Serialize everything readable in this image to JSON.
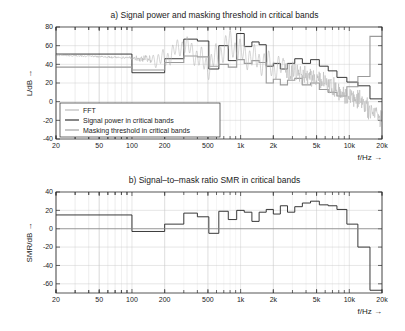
{
  "figure": {
    "xlabel": "f/Hz →",
    "xticks": [
      {
        "v": 20,
        "label": "20"
      },
      {
        "v": 50,
        "label": "50"
      },
      {
        "v": 100,
        "label": "100"
      },
      {
        "v": 200,
        "label": "200"
      },
      {
        "v": 500,
        "label": "500"
      },
      {
        "v": 1000,
        "label": "1k"
      },
      {
        "v": 2000,
        "label": "2k"
      },
      {
        "v": 5000,
        "label": "5k"
      },
      {
        "v": 10000,
        "label": "10k"
      },
      {
        "v": 20000,
        "label": "20k"
      }
    ]
  },
  "chart_data": [
    {
      "type": "line",
      "id": "panel-a",
      "title": "a) Signal power and masking threshold in critical bands",
      "xlabel": "f/Hz →",
      "ylabel": "L/dB →",
      "xscale": "log",
      "xlim": [
        20,
        20000
      ],
      "ylim": [
        -40,
        80
      ],
      "yticks": [
        -40,
        -20,
        0,
        20,
        40,
        60,
        80
      ],
      "ytick_labels": [
        "-40",
        "-20",
        "0",
        "20",
        "40",
        "60",
        "80"
      ],
      "grid": true,
      "legend_position": "lower-left",
      "legend": [
        {
          "name": "FFT",
          "color": "#b4b4b4"
        },
        {
          "name": "Signal power in critical bands",
          "color": "#232323"
        },
        {
          "name": "Masking threshold in critical bands",
          "color": "#9a9a9a"
        }
      ],
      "series": [
        {
          "name": "Signal power in critical bands",
          "color": "#232323",
          "style": "step",
          "band_edges": [
            20,
            100,
            200,
            300,
            400,
            510,
            630,
            770,
            920,
            1080,
            1270,
            1480,
            1720,
            2000,
            2320,
            2700,
            3150,
            3700,
            4400,
            5300,
            6400,
            7700,
            9500,
            12000,
            15500,
            20000
          ],
          "values": [
            51,
            31,
            46,
            67,
            65,
            35,
            60,
            44,
            73,
            59,
            64,
            61,
            38,
            41,
            35,
            41,
            46,
            41,
            45,
            38,
            33,
            26,
            21,
            17,
            3
          ]
        },
        {
          "name": "Masking threshold in critical bands",
          "color": "#9a9a9a",
          "style": "step",
          "band_edges": [
            20,
            100,
            200,
            300,
            400,
            510,
            630,
            770,
            920,
            1080,
            1270,
            1480,
            1720,
            2000,
            2320,
            2700,
            3150,
            3700,
            4400,
            5300,
            6400,
            7700,
            9500,
            12000,
            15500,
            20000
          ],
          "values": [
            37,
            34,
            42,
            49,
            48,
            38,
            40,
            37,
            45,
            41,
            44,
            42,
            20,
            24,
            18,
            23,
            25,
            18,
            20,
            13,
            10,
            6,
            16,
            27,
            70
          ]
        },
        {
          "name": "FFT",
          "color": "#b4b4b4",
          "style": "dense-spectrum",
          "description": "Dense FFT magnitude spectrum, flat near 50 dB below 90 Hz, oscillating 25-73 dB from 200 Hz to 2 kHz, decaying from ~40 dB at 2 kHz to about -25 dB near 20 kHz with increasing noise variance",
          "anchors_hz": [
            20,
            90,
            200,
            300,
            500,
            800,
            1000,
            2000,
            3000,
            5000,
            8000,
            12000,
            20000
          ],
          "anchors_db": [
            50,
            47,
            45,
            62,
            38,
            64,
            52,
            38,
            32,
            26,
            12,
            2,
            -18
          ],
          "noise_db": [
            1,
            1,
            9,
            9,
            12,
            12,
            12,
            12,
            11,
            10,
            10,
            11,
            12
          ]
        }
      ]
    },
    {
      "type": "line",
      "id": "panel-b",
      "title": "b) Signal–to–mask ratio SMR in critical bands",
      "xlabel": "f/Hz →",
      "ylabel": "SMR/dB →",
      "xscale": "log",
      "xlim": [
        20,
        20000
      ],
      "ylim": [
        -70,
        40
      ],
      "yticks": [
        -60,
        -40,
        -20,
        0,
        20,
        40
      ],
      "ytick_labels": [
        "-60",
        "-40",
        "-20",
        "0",
        "20",
        "40"
      ],
      "grid": true,
      "zero_line": 0,
      "series": [
        {
          "name": "SMR in critical bands",
          "color": "#232323",
          "style": "step",
          "band_edges": [
            20,
            100,
            200,
            300,
            400,
            510,
            630,
            770,
            920,
            1080,
            1270,
            1480,
            1720,
            2000,
            2320,
            2700,
            3150,
            3700,
            4400,
            5300,
            6400,
            7700,
            9500,
            12000,
            15500,
            20000
          ],
          "values": [
            15,
            -3,
            5,
            17,
            13,
            -5,
            19,
            10,
            20,
            18,
            8,
            18,
            21,
            16,
            25,
            18,
            24,
            28,
            30,
            26,
            25,
            21,
            5,
            -20,
            -67
          ]
        }
      ]
    }
  ]
}
